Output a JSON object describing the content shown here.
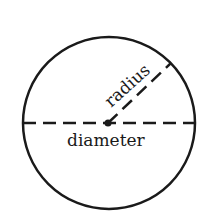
{
  "diagram": {
    "labels": {
      "radius": "radius",
      "diameter": "diameter"
    },
    "colors": {
      "stroke": "#1a1a1a",
      "background": "#ffffff"
    }
  }
}
